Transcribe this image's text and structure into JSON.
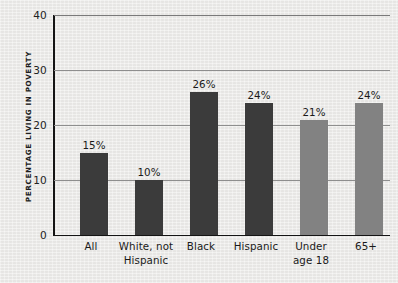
{
  "chart_data": {
    "type": "bar",
    "title": "",
    "xlabel": "",
    "ylabel": "PERCENTAGE LIVING IN POVERTY",
    "ylim": [
      0,
      40
    ],
    "yticks": [
      0,
      10,
      20,
      30,
      40
    ],
    "ytick_labels": [
      "0",
      "10",
      "20",
      "30",
      "40"
    ],
    "grid": true,
    "legend": "none",
    "categories": [
      "All",
      "White, not\nHispanic",
      "Black",
      "Hispanic",
      "Under\nage 18",
      "65+"
    ],
    "values": [
      15,
      10,
      26,
      24,
      21,
      24
    ],
    "data_labels": [
      "15%",
      "10%",
      "26%",
      "24%",
      "21%",
      "24%"
    ],
    "bar_colors": [
      "#3b3b3b",
      "#3b3b3b",
      "#3b3b3b",
      "#3b3b3b",
      "#828282",
      "#828282"
    ]
  },
  "colors": {
    "background": "#ecebe9",
    "axis": "#141414",
    "gridline": "#8e8e8e",
    "bar_dark": "#3b3b3b",
    "bar_light": "#828282",
    "text": "#1a1a1a"
  }
}
